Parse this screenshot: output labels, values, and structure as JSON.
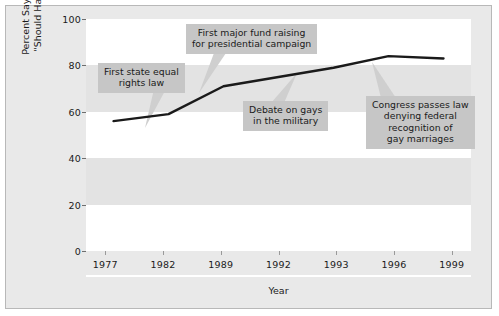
{
  "chart_data": {
    "type": "line",
    "title": "",
    "subtitle": "",
    "xlabel": "Year",
    "ylabel": "Percent Saying Homosexuals \"Should Have Equal Rights\"",
    "ylabel_line1": "Percent Saying Homosexuals",
    "ylabel_line2": "\"Should Have Equal Rights\"",
    "categories": [
      "1977",
      "1982",
      "1989",
      "1992",
      "1993",
      "1996",
      "1999"
    ],
    "values": [
      56,
      59,
      71,
      75,
      79,
      84,
      83
    ],
    "series": [
      {
        "name": "Percent saying homosexuals should have equal rights",
        "values": [
          56,
          59,
          71,
          75,
          79,
          84,
          83
        ]
      }
    ],
    "ylim": [
      0,
      100
    ],
    "yticks": [
      "0",
      "20",
      "40",
      "60",
      "80",
      "100"
    ],
    "ytick_values": [
      0,
      20,
      40,
      60,
      80,
      100
    ],
    "xticks": [
      "1977",
      "1982",
      "1989",
      "1992",
      "1993",
      "1996",
      "1999"
    ],
    "grid": false,
    "banded_background": true,
    "legend": "none",
    "line_color": "#1a1a1a",
    "band_color_light": "#ffffff",
    "band_color_dark": "#e3e3e3",
    "figure_background": "#e9e9e9",
    "annotations": [
      {
        "id": "first-state-equal-rights-law",
        "text": "First state equal rights law",
        "lines": [
          "First state equal",
          "rights law"
        ],
        "points_to_year": "1982",
        "points_to_value": 59
      },
      {
        "id": "first-major-fund-raising",
        "text": "First major fund raising for presidential campaign",
        "lines": [
          "First major fund raising",
          "for presidential campaign"
        ],
        "points_to_year": "1989",
        "points_to_value": 71
      },
      {
        "id": "debate-on-gays-in-the-military",
        "text": "Debate on gays in the military",
        "lines": [
          "Debate on gays",
          "in the military"
        ],
        "points_to_year": "1993",
        "points_to_value": 79
      },
      {
        "id": "congress-passes-law",
        "text": "Congress passes law denying federal recognition of gay marriages",
        "lines": [
          "Congress passes law",
          "denying federal",
          "recognition of",
          "gay marriages"
        ],
        "points_to_year": "1996",
        "points_to_value": 84
      }
    ]
  }
}
